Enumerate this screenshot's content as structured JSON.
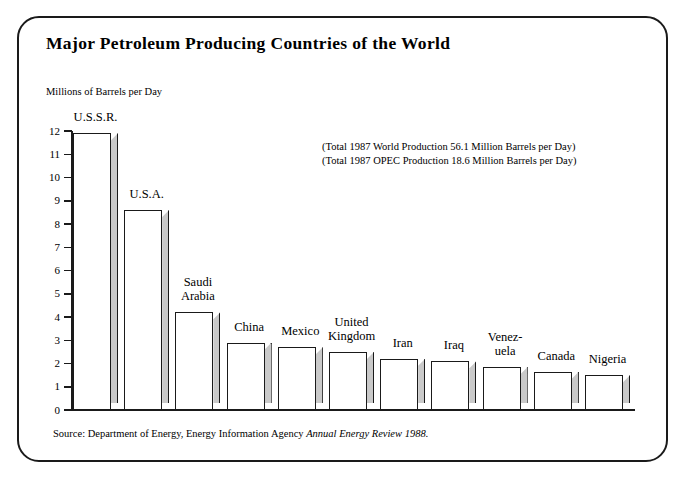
{
  "figure": {
    "title": "Major Petroleum Producing Countries of the World",
    "y_axis_caption": "Millions of Barrels per Day",
    "annotation_line_1": "(Total 1987 World Production 56.1 Million Barrels per Day)",
    "annotation_line_2": "(Total 1987 OPEC Production 18.6 Million Barrels per Day)",
    "source_prefix": "Source: Department of Energy, Energy Information Agency ",
    "source_italic": "Annual Energy Review 1988."
  },
  "chart_data": {
    "type": "bar",
    "title": "Major Petroleum Producing Countries of the World",
    "xlabel": "",
    "ylabel": "Millions of Barrels per Day",
    "ylim": [
      0,
      12
    ],
    "yticks": [
      0,
      1,
      2,
      3,
      4,
      5,
      6,
      7,
      8,
      9,
      10,
      11,
      12
    ],
    "ytick_labels": [
      "0",
      "1",
      "2",
      "3",
      "4",
      "5",
      "6",
      "7",
      "8",
      "9",
      "10",
      "11",
      "12"
    ],
    "grid": false,
    "legend": "none",
    "categories": [
      "U.S.S.R.",
      "U.S.A.",
      "Saudi Arabia",
      "China",
      "Mexico",
      "United Kingdom",
      "Iran",
      "Iraq",
      "Venezuela",
      "Canada",
      "Nigeria"
    ],
    "category_labels": [
      "U.S.S.R.",
      "U.S.A.",
      "Saudi\nArabia",
      "China",
      "Mexico",
      "United\nKingdom",
      "Iran",
      "Iraq",
      "Venez-\nuela",
      "Canada",
      "Nigeria"
    ],
    "values": [
      11.9,
      8.6,
      4.2,
      2.9,
      2.7,
      2.5,
      2.2,
      2.1,
      1.85,
      1.65,
      1.5
    ],
    "annotations": [
      "(Total 1987 World Production 56.1 Million Barrels per Day)",
      "(Total 1987 OPEC Production 18.6 Million Barrels per Day)"
    ],
    "source": "Source: Department of Energy, Energy Information Agency Annual Energy Review 1988.",
    "colors": {
      "bar_face": "#ffffff",
      "bar_side": "#c9c9c9",
      "outline": "#1a1a1a",
      "background": "#ffffff"
    }
  }
}
